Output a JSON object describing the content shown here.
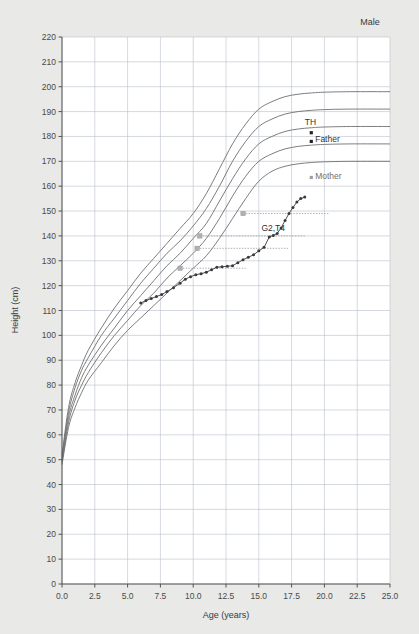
{
  "figure": {
    "panel_title": "Male",
    "background_color": "#e9e9e7",
    "plot_background": "#ffffff",
    "grid_color": "#b9bfc9",
    "axis_color": "#555555"
  },
  "chart_data": {
    "type": "line",
    "title": "Male",
    "xlabel": "Age (years)",
    "ylabel": "Height (cm)",
    "xlim": [
      0.0,
      25.0
    ],
    "ylim": [
      0,
      220
    ],
    "xticks": [
      "0.0",
      "2.5",
      "5.0",
      "7.5",
      "10.0",
      "12.5",
      "15.0",
      "17.5",
      "20.0",
      "22.5",
      "25.0"
    ],
    "xtick_values": [
      0.0,
      2.5,
      5.0,
      7.5,
      10.0,
      12.5,
      15.0,
      17.5,
      20.0,
      22.5,
      25.0
    ],
    "yticks": [
      "0",
      "10",
      "20",
      "30",
      "40",
      "50",
      "60",
      "70",
      "80",
      "90",
      "100",
      "110",
      "120",
      "130",
      "140",
      "150",
      "160",
      "170",
      "180",
      "190",
      "200",
      "210",
      "220"
    ],
    "ytick_values": [
      0,
      10,
      20,
      30,
      40,
      50,
      60,
      70,
      80,
      90,
      100,
      110,
      120,
      130,
      140,
      150,
      160,
      170,
      180,
      190,
      200,
      210,
      220
    ],
    "grid": true,
    "legend_position": "none",
    "reference_curve_color": "#6e6e6e",
    "patient_curve_color": "#3a3a3a",
    "projection_color": "#9a9a9a",
    "series": [
      {
        "name": "reference-p97",
        "kind": "reference",
        "x": [
          0,
          0.5,
          1,
          1.5,
          2,
          3,
          4,
          5,
          6,
          7,
          8,
          9,
          10,
          11,
          12,
          13,
          14,
          15,
          16,
          17,
          18,
          19,
          20,
          22,
          25
        ],
        "values": [
          52,
          71,
          81,
          88,
          94,
          103,
          111,
          118,
          125,
          131,
          137,
          143,
          149,
          157,
          167,
          177,
          185,
          191,
          194,
          196,
          197,
          197.5,
          197.8,
          198,
          198
        ]
      },
      {
        "name": "reference-p90",
        "kind": "reference",
        "x": [
          0,
          0.5,
          1,
          1.5,
          2,
          3,
          4,
          5,
          6,
          7,
          8,
          9,
          10,
          11,
          12,
          13,
          14,
          15,
          16,
          17,
          18,
          19,
          20,
          22,
          25
        ],
        "values": [
          51,
          69,
          79,
          86,
          91,
          100,
          107,
          114,
          121,
          127,
          133,
          138,
          144,
          151,
          160,
          170,
          178,
          184,
          187,
          189,
          190,
          190.5,
          190.8,
          191,
          191
        ]
      },
      {
        "name": "reference-p50",
        "kind": "reference",
        "x": [
          0,
          0.5,
          1,
          1.5,
          2,
          3,
          4,
          5,
          6,
          7,
          8,
          9,
          10,
          11,
          12,
          13,
          14,
          15,
          16,
          17,
          18,
          19,
          20,
          22,
          25
        ],
        "values": [
          50,
          67,
          76,
          83,
          88,
          96,
          103,
          110,
          116,
          122,
          128,
          133,
          139,
          145,
          154,
          163,
          171,
          177,
          180,
          182,
          183,
          183.5,
          183.8,
          184,
          184
        ]
      },
      {
        "name": "reference-p10",
        "kind": "reference",
        "x": [
          0,
          0.5,
          1,
          1.5,
          2,
          3,
          4,
          5,
          6,
          7,
          8,
          9,
          10,
          11,
          12,
          13,
          14,
          15,
          16,
          17,
          18,
          19,
          20,
          22,
          25
        ],
        "values": [
          49,
          65,
          74,
          80,
          85,
          93,
          100,
          106,
          112,
          117,
          123,
          128,
          133,
          139,
          147,
          156,
          164,
          170,
          173,
          175,
          176,
          176.5,
          176.8,
          177,
          177
        ]
      },
      {
        "name": "reference-p3",
        "kind": "reference",
        "x": [
          0,
          0.5,
          1,
          1.5,
          2,
          3,
          4,
          5,
          6,
          7,
          8,
          9,
          10,
          11,
          12,
          13,
          14,
          15,
          16,
          17,
          18,
          19,
          20,
          22,
          25
        ],
        "values": [
          48,
          63,
          71,
          77,
          82,
          89,
          96,
          102,
          107,
          112,
          117,
          122,
          127,
          132,
          139,
          147,
          155,
          162,
          166,
          168,
          169,
          169.5,
          169.8,
          170,
          170
        ]
      },
      {
        "name": "patient-height",
        "kind": "measurement",
        "x": [
          6.0,
          6.4,
          6.8,
          7.2,
          7.6,
          8.0,
          8.5,
          9.0,
          9.4,
          9.8,
          10.2,
          10.6,
          11.0,
          11.4,
          11.8,
          12.2,
          12.6,
          13.0,
          13.4,
          13.8,
          14.2,
          14.6,
          15.0,
          15.4,
          15.8,
          16.1,
          16.4,
          16.7,
          17.0,
          17.3,
          17.6,
          17.9,
          18.2,
          18.5
        ],
        "values": [
          113.0,
          114.0,
          114.8,
          115.6,
          116.4,
          117.6,
          119.2,
          121.0,
          122.6,
          123.6,
          124.4,
          124.8,
          125.4,
          126.4,
          127.4,
          127.6,
          127.8,
          128.0,
          129.2,
          130.4,
          131.4,
          132.4,
          134.0,
          135.4,
          139.6,
          140.2,
          141.0,
          143.2,
          146.2,
          149.0,
          151.4,
          153.6,
          155.0,
          155.6
        ]
      }
    ],
    "projections": [
      {
        "name": "projection-1",
        "height": 127.0,
        "x_start": 9.0,
        "x_end": 14.0
      },
      {
        "name": "projection-2",
        "height": 135.0,
        "x_start": 10.3,
        "x_end": 17.3
      },
      {
        "name": "projection-3",
        "height": 140.0,
        "x_start": 10.5,
        "x_end": 18.6
      },
      {
        "name": "projection-4",
        "height": 149.0,
        "x_start": 13.8,
        "x_end": 20.3
      }
    ],
    "annotations": [
      {
        "name": "th-label",
        "text": "TH",
        "age": 18.5,
        "height": 184.5,
        "marker": true,
        "marker_age": 19.0,
        "marker_height": 181.5,
        "style": "dark"
      },
      {
        "name": "father-label",
        "text": "Father",
        "age": 19.3,
        "height": 177.8,
        "marker": true,
        "marker_age": 19.0,
        "marker_height": 178.0,
        "style": "dark"
      },
      {
        "name": "mother-label",
        "text": "Mother",
        "age": 19.3,
        "height": 163.0,
        "marker": true,
        "marker_age": 19.0,
        "marker_height": 163.5,
        "style": "light"
      },
      {
        "name": "stage-label",
        "text": "G2,T4",
        "age": 15.2,
        "height": 142.0,
        "marker": false,
        "style": "dark"
      }
    ]
  }
}
